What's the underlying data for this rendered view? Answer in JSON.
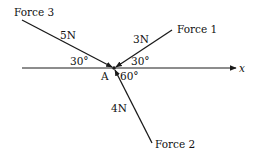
{
  "diagram": {
    "colors": {
      "stroke": "#1a1a1a",
      "text": "#111111",
      "background": "#ffffff"
    },
    "origin_label": "A",
    "axis": {
      "label": "x"
    },
    "forces": [
      {
        "name": "Force 1",
        "magnitude": "3N",
        "angle_label": "30°",
        "angle_from": "positive x-axis, above"
      },
      {
        "name": "Force 2",
        "magnitude": "4N",
        "angle_label": "60°",
        "angle_from": "positive x-axis, below"
      },
      {
        "name": "Force 3",
        "magnitude": "5N",
        "angle_label": "30°",
        "angle_from": "negative x-axis, above"
      }
    ]
  }
}
